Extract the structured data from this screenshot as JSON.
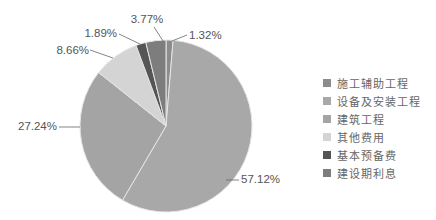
{
  "chart_data": {
    "type": "pie",
    "title": "",
    "start_angle": "12 o'clock, clockwise",
    "categories": [
      "施工辅助工程",
      "设备及安装工程",
      "建筑工程",
      "其他费用",
      "基本预备费",
      "建设期利息"
    ],
    "values": [
      1.32,
      57.12,
      27.24,
      8.66,
      1.89,
      3.77
    ],
    "labels": [
      "1.32%",
      "57.12%",
      "27.24%",
      "8.66%",
      "1.89%",
      "3.77%"
    ],
    "colors": [
      "#8c8c8c",
      "#a8a8a8",
      "#a4a4a4",
      "#d4d4d4",
      "#555555",
      "#7d7d7d"
    ],
    "legend_position": "right"
  },
  "legend": {
    "items": [
      {
        "label": "施工辅助工程",
        "color": "#8c8c8c"
      },
      {
        "label": "设备及安装工程",
        "color": "#a8a8a8"
      },
      {
        "label": "建筑工程",
        "color": "#a4a4a4"
      },
      {
        "label": "其他费用",
        "color": "#d4d4d4"
      },
      {
        "label": "基本预备费",
        "color": "#555555"
      },
      {
        "label": "建设期利息",
        "color": "#7d7d7d"
      }
    ]
  }
}
